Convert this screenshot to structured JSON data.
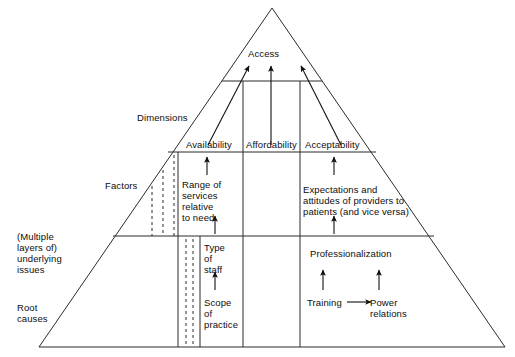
{
  "diagram": {
    "type": "pyramid-hierarchy-diagram",
    "apex_label": "Access",
    "row_labels": [
      {
        "id": "dimensions",
        "label": "Dimensions"
      },
      {
        "id": "factors",
        "label": "Factors"
      },
      {
        "id": "underlying-issues",
        "label": "(Multiple\nlayers of)\nunderlying\nissues"
      },
      {
        "id": "root-causes",
        "label": "Root\ncauses"
      }
    ],
    "dimensions": [
      {
        "id": "availability",
        "label": "Availability"
      },
      {
        "id": "affordability",
        "label": "Affordability"
      },
      {
        "id": "acceptability",
        "label": "Acceptability"
      }
    ],
    "factors": [
      {
        "id": "range-of-services",
        "column": "availability",
        "label": "Range of\nservices\nrelative\nto need"
      },
      {
        "id": "expectations-attitudes",
        "column": "acceptability",
        "label": "Expectations and\nattitudes of providers to\npatients (and vice versa)"
      }
    ],
    "underlying_issues": [
      {
        "id": "type-of-staff",
        "column": "availability",
        "label": "Type\nof\nstaff"
      },
      {
        "id": "professionalization",
        "column": "acceptability",
        "label": "Professionalization"
      }
    ],
    "root_causes": [
      {
        "id": "scope-of-practice",
        "column": "availability",
        "label": "Scope\nof\npractice"
      },
      {
        "id": "training",
        "column": "acceptability",
        "label": "Training"
      },
      {
        "id": "power-relations",
        "column": "acceptability",
        "label": "Power\nrelations"
      }
    ],
    "colors": {
      "line": "#2b2b2b",
      "arrow": "#111111",
      "text": "#0d0d0d",
      "background": "#ffffff"
    }
  }
}
